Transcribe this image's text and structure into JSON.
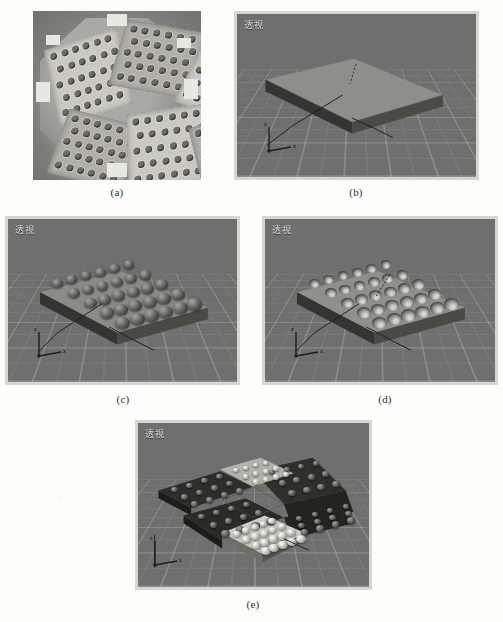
{
  "page": {
    "background_color": "#fdfdfc",
    "figure_kind": "scanned-journal-figure",
    "subfigure_count": 5
  },
  "viewport_style": {
    "background_color": "#6f6f6f",
    "border_color": "#d6d6d2",
    "label_color": "#d9d9d9",
    "grid_color": "#ffffff"
  },
  "figures": [
    {
      "id": "a",
      "caption": "(a)",
      "type": "photograph",
      "description": "grayscale photo of fabricated hexagonal star assembly with perforated facet plates",
      "viewport_label": null
    },
    {
      "id": "b",
      "caption": "(b)",
      "type": "viewport-render",
      "viewport_label": "透视",
      "description": "flat rectangular base slab, no features",
      "bump_rows": 0,
      "bump_cols": 0,
      "bump_style": "none"
    },
    {
      "id": "c",
      "caption": "(c)",
      "type": "viewport-render",
      "viewport_label": "透视",
      "description": "slab with array of dark raised hemispherical bumps",
      "bump_rows": 5,
      "bump_cols": 6,
      "bump_style": "raised-dark"
    },
    {
      "id": "d",
      "caption": "(d)",
      "type": "viewport-render",
      "viewport_label": "透视",
      "description": "slab with array of light recessed dimples / spherical cavities",
      "bump_rows": 5,
      "bump_cols": 6,
      "bump_style": "recessed-light"
    },
    {
      "id": "e",
      "caption": "(e)",
      "type": "viewport-render",
      "viewport_label": "透视",
      "description": "six patterned facet plates assembled into a six-point star, alternating dark and light finishes",
      "facets": [
        {
          "index": 0,
          "finish": "dark"
        },
        {
          "index": 1,
          "finish": "light"
        },
        {
          "index": 2,
          "finish": "dark"
        },
        {
          "index": 3,
          "finish": "light"
        },
        {
          "index": 4,
          "finish": "dark"
        },
        {
          "index": 5,
          "finish": "light"
        }
      ]
    }
  ],
  "icons": {
    "axis_tripod": "axis-tripod-icon",
    "axis_labels": [
      "x",
      "y",
      "z"
    ]
  }
}
